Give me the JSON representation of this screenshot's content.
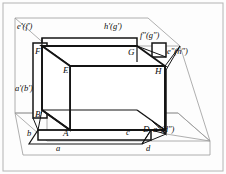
{
  "figure": {
    "name": "cube-three-view-projection",
    "colors": {
      "ink": "#0a0a0a",
      "plane_line": "#9a9a9a",
      "frame": "#b0b0b0",
      "background": "#fdfdfd"
    },
    "labels": {
      "ef_prime": "e'(f')",
      "hg_prime": "h'(g')",
      "fg_dprime": "f\"(g\")",
      "eh_dprime": "e\"(h\")",
      "ab_prime": "a'(b')",
      "ad_dprime": "a\"(d\")",
      "F": "F",
      "E": "E",
      "G": "G",
      "H": "H",
      "B": "B",
      "A": "A",
      "D": "D",
      "b": "b",
      "a": "a",
      "c": "c",
      "d": "d"
    }
  }
}
